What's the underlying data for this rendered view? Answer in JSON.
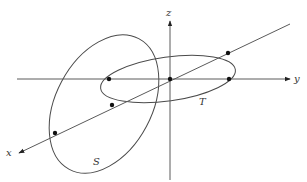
{
  "diagram": {
    "axes": {
      "x": {
        "label": "x"
      },
      "y": {
        "label": "y"
      },
      "z": {
        "label": "z"
      }
    },
    "surfaces": [
      {
        "id": "S",
        "label": "S",
        "description": "tall tilted oval surface crossing the x-axis and y-axis"
      },
      {
        "id": "T",
        "label": "T",
        "description": "shaded tilted elliptical surface lying along the x-y plane"
      }
    ],
    "points": [
      {
        "name": "origin",
        "x": 170,
        "y": 79
      },
      {
        "name": "T-left-y-axis",
        "x": 109,
        "y": 79
      },
      {
        "name": "T-right-y-axis",
        "x": 229,
        "y": 79
      },
      {
        "name": "T-upper-x-axis",
        "x": 228,
        "y": 53
      },
      {
        "name": "T-lower-x-axis",
        "x": 112,
        "y": 105
      },
      {
        "name": "S-lower-x-axis",
        "x": 55,
        "y": 133
      }
    ],
    "colors": {
      "axis": "#5a5a5a",
      "curve": "#4a4a4a",
      "shade": "#d8d8d8",
      "dot": "#111111"
    }
  }
}
